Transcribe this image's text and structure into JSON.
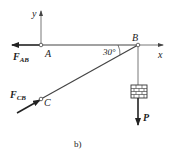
{
  "diagram": {
    "caption": "b)",
    "points": {
      "A": "A",
      "B": "B",
      "C": "C"
    },
    "axes": {
      "x": "x",
      "y": "y"
    },
    "angle_label": "30°",
    "forces": {
      "F_AB": {
        "main": "F",
        "sub": "AB"
      },
      "F_CB": {
        "main": "F",
        "sub": "CB"
      },
      "P": "P"
    },
    "colors": {
      "line": "#444444",
      "text": "#222222"
    }
  }
}
